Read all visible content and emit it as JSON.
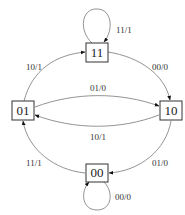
{
  "diagram": {
    "type": "state-machine",
    "states": [
      {
        "id": "s11",
        "label": "11"
      },
      {
        "id": "s01",
        "label": "01"
      },
      {
        "id": "s10",
        "label": "10"
      },
      {
        "id": "s00",
        "label": "00"
      }
    ],
    "transitions": [
      {
        "from": "11",
        "to": "11",
        "label": "11/1"
      },
      {
        "from": "01",
        "to": "11",
        "label": "10/1"
      },
      {
        "from": "11",
        "to": "10",
        "label": "00/0"
      },
      {
        "from": "01",
        "to": "10",
        "label": "01/0"
      },
      {
        "from": "10",
        "to": "01",
        "label": "10/1"
      },
      {
        "from": "00",
        "to": "01",
        "label": "11/1"
      },
      {
        "from": "10",
        "to": "00",
        "label": "01/0"
      },
      {
        "from": "00",
        "to": "00",
        "label": "00/0"
      }
    ]
  }
}
